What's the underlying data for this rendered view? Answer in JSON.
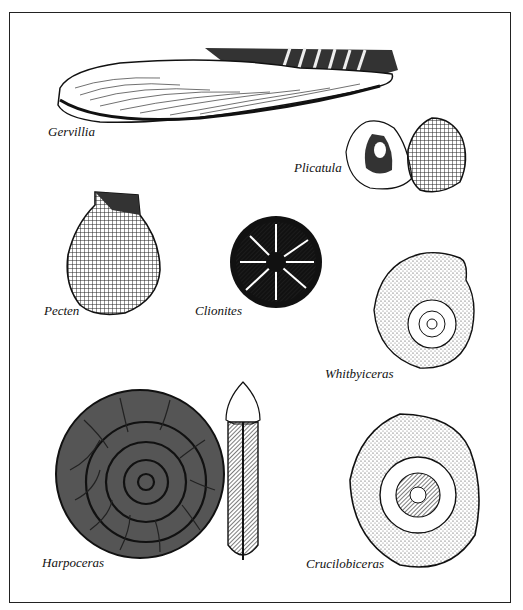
{
  "plate": {
    "specimens": [
      {
        "id": "gervillia",
        "label": "Gervillia",
        "type": "bivalve"
      },
      {
        "id": "plicatula",
        "label": "Plicatula",
        "type": "bivalve"
      },
      {
        "id": "pecten",
        "label": "Pecten",
        "type": "bivalve"
      },
      {
        "id": "clionites",
        "label": "Clionites",
        "type": "ammonite"
      },
      {
        "id": "whitbyiceras",
        "label": "Whitbyiceras",
        "type": "ammonite"
      },
      {
        "id": "harpoceras",
        "label": "Harpoceras",
        "type": "ammonite"
      },
      {
        "id": "crucilobiceras",
        "label": "Crucilobiceras",
        "type": "ammonite"
      }
    ]
  }
}
